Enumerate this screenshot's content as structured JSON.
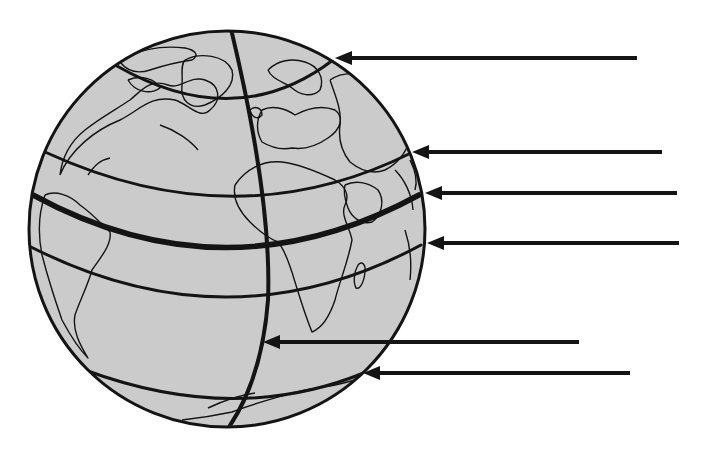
{
  "diagram": {
    "type": "globe-latitude-lines",
    "colors": {
      "background": "#ffffff",
      "globe_fill": "#cbcbcb",
      "line": "#141414"
    },
    "globe": {
      "cx": 227,
      "cy": 229,
      "r": 198
    },
    "lines": [
      {
        "id": "arctic-circle",
        "label": "",
        "path": "M117,66 Q236,134 333,60",
        "width": 3
      },
      {
        "id": "tropic-of-cancer",
        "label": "",
        "path": "M45,152 Q236,240 411,153",
        "width": 3
      },
      {
        "id": "equator",
        "label": "",
        "path": "M33,195 Q226,300 419,195",
        "width": 5.5
      },
      {
        "id": "tropic-of-capricorn",
        "label": "",
        "path": "M31,247 Q230,348 421,245",
        "width": 3
      },
      {
        "id": "antarctic-circle",
        "label": "",
        "path": "M85,370 Q236,426 366,372",
        "width": 3
      },
      {
        "id": "prime-meridian",
        "label": "",
        "path": "M231,29 Q272,200 268,300 Q262,380 227,430",
        "width": 4
      }
    ],
    "arrows": [
      {
        "id": "arrow-1",
        "target": "arctic-circle",
        "tip_x": 335,
        "y": 58,
        "end_x": 637
      },
      {
        "id": "arrow-2",
        "target": "tropic-of-cancer",
        "tip_x": 412,
        "y": 152,
        "end_x": 662
      },
      {
        "id": "arrow-3",
        "target": "equator",
        "tip_x": 425,
        "y": 193,
        "end_x": 677
      },
      {
        "id": "arrow-4",
        "target": "tropic-of-capricorn",
        "tip_x": 427,
        "y": 243,
        "end_x": 679
      },
      {
        "id": "arrow-5",
        "target": "prime-meridian",
        "tip_x": 263,
        "y": 342,
        "end_x": 579
      },
      {
        "id": "arrow-6",
        "target": "antarctic-circle",
        "tip_x": 363,
        "y": 373,
        "end_x": 630
      }
    ],
    "continents": [
      {
        "id": "north-america",
        "path": "M60,175 C70,150 95,130 120,120 C140,110 150,95 175,100 C190,105 200,120 210,110 C222,100 220,85 205,80 C190,75 180,90 168,85 C150,78 140,92 130,100 C115,110 100,118 85,130 C70,142 62,158 60,175 M160,125 C175,130 190,140 198,150 M88,175 C95,165 100,160 110,158"
      },
      {
        "id": "greenland",
        "path": "M185,60 C200,52 225,55 232,70 C236,85 222,98 205,105 C190,110 180,100 182,85 C183,75 180,66 185,60"
      },
      {
        "id": "canada-islands",
        "path": "M120,62 C135,50 160,45 185,48 C195,50 200,55 192,60 C178,62 165,65 150,70 C138,74 128,72 120,62 M128,80 C140,75 155,78 160,88 C150,95 135,92 128,80"
      },
      {
        "id": "south-america",
        "path": "M45,195 C55,190 70,195 80,205 C90,212 100,222 110,232 C112,245 100,258 92,270 C88,285 80,300 75,315 C72,330 80,345 88,358 C80,350 70,335 62,320 C55,300 48,278 42,255 C38,235 38,215 45,195"
      },
      {
        "id": "africa",
        "path": "M235,185 C245,170 262,160 282,162 C300,164 318,172 335,180 C345,186 350,195 345,205 C340,215 350,228 352,240 C348,262 340,280 335,300 C330,315 322,328 312,332 C305,315 300,298 295,282 C290,265 285,250 278,242 C268,238 258,230 250,222 C240,212 232,200 235,185"
      },
      {
        "id": "europe",
        "path": "M262,110 C272,105 285,108 295,115 C308,108 322,105 335,110 C345,118 340,130 328,138 C318,145 305,150 292,148 C282,150 272,148 262,142 C256,132 256,120 262,110 M250,110 C255,105 262,108 262,115 C258,120 252,118 250,110"
      },
      {
        "id": "scandinavia",
        "path": "M268,70 C278,60 292,58 305,62 C318,66 325,78 320,90 C312,98 300,95 292,88 C285,82 272,80 268,70"
      },
      {
        "id": "asia",
        "path": "M330,80 C345,70 365,72 380,85 C395,98 405,120 410,140 C405,155 395,165 385,170 C372,175 360,170 350,162 C342,152 338,140 340,125 C342,110 335,95 330,80 M395,170 C405,180 412,195 413,210 M405,230 C410,245 412,262 410,280"
      },
      {
        "id": "arabia",
        "path": "M345,185 C355,180 368,182 378,190 C385,200 382,215 372,222 C362,225 352,218 348,208 C345,200 343,192 345,185"
      },
      {
        "id": "madagascar",
        "path": "M358,265 C362,260 366,265 365,272 C364,282 360,290 356,288 C353,282 354,272 358,265"
      },
      {
        "id": "india-coast",
        "path": "M410,160 C415,170 418,180 415,190"
      },
      {
        "id": "antarctica",
        "path": "M182,420 C200,418 218,415 232,412 C250,405 268,400 285,395 C300,390 318,388 335,385 C345,383 355,380 365,377 M208,408 C225,400 240,395 255,393"
      }
    ]
  }
}
